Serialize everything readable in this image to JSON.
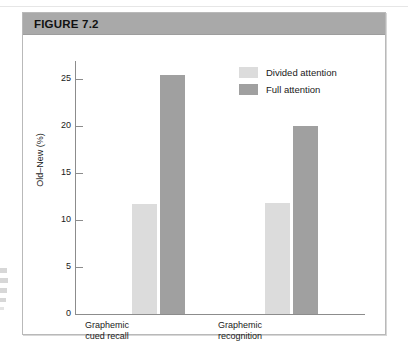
{
  "figure": {
    "title": "FIGURE 7.2",
    "header_color": "#a9a9a9"
  },
  "chart_data": {
    "type": "bar",
    "title": "FIGURE 7.2",
    "xlabel": "",
    "ylabel": "Old–New (%)",
    "ylim": [
      0,
      27
    ],
    "yticks": [
      0,
      5,
      10,
      15,
      20,
      25
    ],
    "ytick_labels": [
      "0",
      "5",
      "10",
      "15",
      "20",
      "25"
    ],
    "grid": false,
    "legend_position": "upper right (inside plot)",
    "categories": [
      "Graphemic cued recall",
      "Graphemic recognition"
    ],
    "category_lines": [
      [
        "Graphemic",
        "cued recall"
      ],
      [
        "Graphemic",
        "recognition"
      ]
    ],
    "series": [
      {
        "name": "Divided attention",
        "color": "#dcdcdc",
        "values": [
          11.7,
          11.9
        ]
      },
      {
        "name": "Full attention",
        "color": "#a0a0a0",
        "values": [
          25.5,
          20.1
        ]
      }
    ]
  }
}
